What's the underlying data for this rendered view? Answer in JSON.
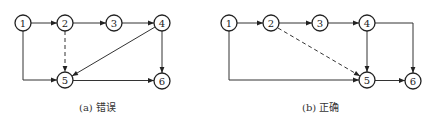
{
  "panels": [
    {
      "id": "a",
      "caption": "(a) 错误",
      "nodes": [
        {
          "label": "1",
          "x": 23,
          "y": 23
        },
        {
          "label": "2",
          "x": 65,
          "y": 23
        },
        {
          "label": "3",
          "x": 114,
          "y": 23
        },
        {
          "label": "4",
          "x": 162,
          "y": 23
        },
        {
          "label": "5",
          "x": 65,
          "y": 80
        },
        {
          "label": "6",
          "x": 162,
          "y": 81
        }
      ],
      "edges": [
        {
          "from": "1",
          "to": "2",
          "style": "solid"
        },
        {
          "from": "2",
          "to": "3",
          "style": "solid"
        },
        {
          "from": "3",
          "to": "4",
          "style": "solid"
        },
        {
          "from": "1",
          "to": "5",
          "style": "solid",
          "route": "down-then-right"
        },
        {
          "from": "2",
          "to": "5",
          "style": "dashed"
        },
        {
          "from": "4",
          "to": "5",
          "style": "solid"
        },
        {
          "from": "4",
          "to": "6",
          "style": "solid"
        },
        {
          "from": "5",
          "to": "6",
          "style": "solid"
        }
      ]
    },
    {
      "id": "b",
      "caption": "(b) 正确",
      "nodes": [
        {
          "label": "1",
          "x": 229,
          "y": 23
        },
        {
          "label": "2",
          "x": 271,
          "y": 23
        },
        {
          "label": "3",
          "x": 320,
          "y": 23
        },
        {
          "label": "4",
          "x": 367,
          "y": 23
        },
        {
          "label": "5",
          "x": 367,
          "y": 80
        },
        {
          "label": "6",
          "x": 413,
          "y": 81
        }
      ],
      "edges": [
        {
          "from": "1",
          "to": "2",
          "style": "solid"
        },
        {
          "from": "2",
          "to": "3",
          "style": "solid"
        },
        {
          "from": "3",
          "to": "4",
          "style": "solid"
        },
        {
          "from": "1",
          "to": "5",
          "style": "solid",
          "route": "down-then-right"
        },
        {
          "from": "2",
          "to": "5",
          "style": "dashed"
        },
        {
          "from": "4",
          "to": "5",
          "style": "solid"
        },
        {
          "from": "4",
          "to": "6",
          "style": "solid",
          "route": "right-then-down"
        },
        {
          "from": "5",
          "to": "6",
          "style": "solid"
        }
      ]
    }
  ],
  "colors": {
    "stroke": "#222222",
    "background": "#ffffff"
  }
}
